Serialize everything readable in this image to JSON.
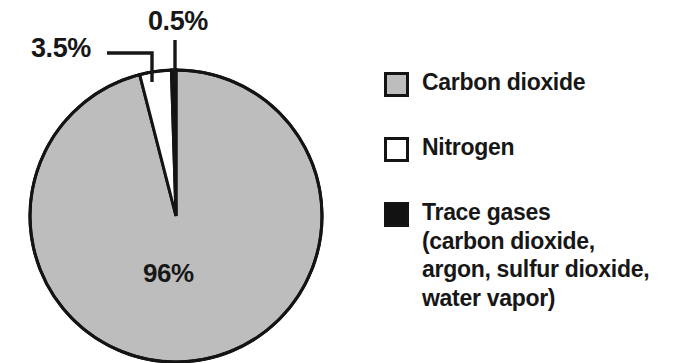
{
  "chart_data": {
    "type": "pie",
    "title": "",
    "subtitle": "",
    "xlabel": "",
    "ylabel": "",
    "grid": false,
    "legend_position": "right",
    "units": "percent",
    "center": {
      "x": 176,
      "y": 216
    },
    "radius": 146,
    "start_angle_deg": 0,
    "direction": "clockwise",
    "categories": [
      "Carbon dioxide",
      "Nitrogen",
      "Trace gases"
    ],
    "values": [
      96,
      3.5,
      0.5
    ],
    "value_labels": [
      "96%",
      "3.5%",
      "0.5%"
    ],
    "colors": [
      "#bdbdbd",
      "#ffffff",
      "#121212"
    ],
    "slices": [
      {
        "label": "Carbon dioxide",
        "value": 96,
        "value_label": "96%",
        "color": "#bdbdbd",
        "label_placement": "inside"
      },
      {
        "label": "Nitrogen",
        "value": 3.5,
        "value_label": "3.5%",
        "color": "#ffffff",
        "label_placement": "callout-left"
      },
      {
        "label": "Trace gases",
        "value": 0.5,
        "value_label": "0.5%",
        "color": "#121212",
        "label_placement": "callout-top"
      }
    ]
  },
  "callouts": {
    "nitrogen_pct": "3.5%",
    "trace_pct": "0.5%",
    "carbon_pct": "96%"
  },
  "legend": {
    "items": [
      {
        "label": "Carbon dioxide",
        "detail": "",
        "swatch_name": "legend-swatch-gray",
        "color": "#bdbdbd"
      },
      {
        "label": "Nitrogen",
        "detail": "",
        "swatch_name": "legend-swatch-white",
        "color": "#ffffff"
      },
      {
        "label": "Trace gases",
        "detail_line1": "(carbon dioxide,",
        "detail_line2": "argon, sulfur dioxide,",
        "detail_line3": "water vapor)",
        "swatch_name": "legend-swatch-black",
        "color": "#121212"
      }
    ]
  },
  "colors": {
    "background": "#ffffff",
    "outline": "#141414",
    "text": "#171717",
    "slice_carbon_dioxide": "#bdbdbd",
    "slice_nitrogen": "#ffffff",
    "slice_trace_gases": "#121212"
  }
}
